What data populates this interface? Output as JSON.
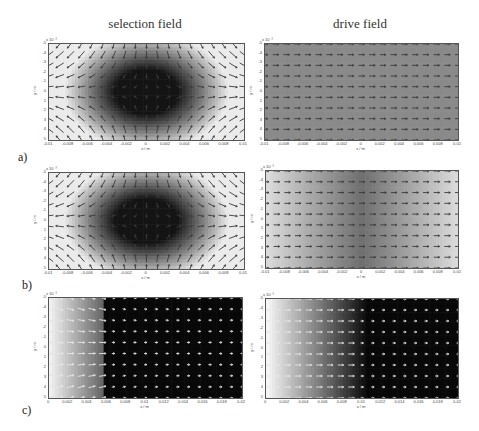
{
  "columns": {
    "left_title": "selection field",
    "right_title": "drive field"
  },
  "panel_labels": [
    "a)",
    "b)",
    "c)"
  ],
  "axes": {
    "exponent": "x 10⁻³",
    "xlabel": "x / m",
    "ylabel": "y / m",
    "yticks": [
      "-5",
      "-4",
      "-3",
      "-2",
      "-1",
      "0",
      "1",
      "2",
      "3",
      "4",
      "5"
    ],
    "xticks_symmetric": [
      "-0.01",
      "-0.008",
      "-0.006",
      "-0.004",
      "-0.002",
      "0",
      "0.002",
      "0.004",
      "0.006",
      "0.008",
      "0.01"
    ],
    "xticks_positive": [
      "0",
      "0.002",
      "0.004",
      "0.006",
      "0.008",
      "0.01",
      "0.012",
      "0.014",
      "0.016",
      "0.018",
      "0.02"
    ]
  },
  "chart_data": [
    {
      "id": "a-selection",
      "type": "heatmap",
      "title": "selection field",
      "panel": "a)",
      "description": "Quiver plot over grayscale field magnitude; dark ellipse (field-free region) centered at origin, arrows pointing inward along y and outward along x",
      "xlabel": "x / m",
      "ylabel": "y / m",
      "xlim": [
        -0.01,
        0.01
      ],
      "ylim": [
        -0.005,
        0.005
      ],
      "xticks": [
        "-0.01",
        "-0.008",
        "-0.006",
        "-0.004",
        "-0.002",
        "0",
        "0.002",
        "0.004",
        "0.006",
        "0.008",
        "0.01"
      ],
      "yticks": [
        "-5",
        "-4",
        "-3",
        "-2",
        "-1",
        "0",
        "1",
        "2",
        "3",
        "4",
        "5"
      ],
      "y_scale": "x 10^-3",
      "dark_region": {
        "center": [
          0,
          0
        ],
        "half_width_x": 0.0035,
        "half_height_y": 0.0025
      }
    },
    {
      "id": "a-drive",
      "type": "heatmap",
      "title": "drive field",
      "panel": "a)",
      "description": "Uniform gray field with horizontal arrows pointing in +x direction",
      "xlabel": "x / m",
      "ylabel": "y / m",
      "xlim": [
        -0.01,
        0.01
      ],
      "ylim": [
        -0.005,
        0.005
      ],
      "xticks": [
        "-0.01",
        "-0.008",
        "-0.006",
        "-0.004",
        "-0.002",
        "0",
        "0.002",
        "0.004",
        "0.006",
        "0.008",
        "0.01"
      ],
      "yticks": [
        "-5",
        "-4",
        "-3",
        "-2",
        "-1",
        "0",
        "1",
        "2",
        "3",
        "4",
        "5"
      ],
      "y_scale": "x 10^-3",
      "uniform_gray": "#8a8a8a"
    },
    {
      "id": "b-selection",
      "type": "heatmap",
      "title": "selection field",
      "panel": "b)",
      "description": "Same as a) selection field: dark elliptical field-free region at center with converging/diverging arrows",
      "xlabel": "x / m",
      "ylabel": "y / m",
      "xlim": [
        -0.01,
        0.01
      ],
      "ylim": [
        -0.005,
        0.005
      ],
      "xticks": [
        "-0.01",
        "-0.008",
        "-0.006",
        "-0.004",
        "-0.002",
        "0",
        "0.002",
        "0.004",
        "0.006",
        "0.008",
        "0.01"
      ],
      "yticks": [
        "-5",
        "-4",
        "-3",
        "-2",
        "-1",
        "0",
        "1",
        "2",
        "3",
        "4",
        "5"
      ],
      "y_scale": "x 10^-3"
    },
    {
      "id": "b-drive",
      "type": "heatmap",
      "title": "drive field",
      "panel": "b)",
      "description": "Gray field darker at center, lighter toward x edges; horizontal arrows pointing +x",
      "xlabel": "x / m",
      "ylabel": "y / m",
      "xlim": [
        -0.01,
        0.01
      ],
      "ylim": [
        -0.005,
        0.005
      ],
      "xticks": [
        "-0.01",
        "-0.008",
        "-0.006",
        "-0.004",
        "-0.002",
        "0",
        "0.002",
        "0.004",
        "0.006",
        "0.008",
        "0.01"
      ],
      "yticks": [
        "-5",
        "-4",
        "-3",
        "-2",
        "-1",
        "0",
        "1",
        "2",
        "3",
        "4",
        "5"
      ],
      "y_scale": "x 10^-3"
    },
    {
      "id": "c-selection",
      "type": "heatmap",
      "title": "selection field",
      "panel": "c)",
      "description": "Light gradient at x=0 to ~0.006, black beyond; small white arrows",
      "xlabel": "x / m",
      "ylabel": "y / m",
      "xlim": [
        0,
        0.02
      ],
      "ylim": [
        -0.005,
        0.005
      ],
      "xticks": [
        "0",
        "0.002",
        "0.004",
        "0.006",
        "0.008",
        "0.01",
        "0.012",
        "0.014",
        "0.016",
        "0.018",
        "0.02"
      ],
      "yticks": [
        "-5",
        "-4",
        "-3",
        "-2",
        "-1",
        "0",
        "1",
        "2",
        "3",
        "4",
        "5"
      ],
      "y_scale": "x 10^-3",
      "transition_x": 0.006
    },
    {
      "id": "c-drive",
      "type": "heatmap",
      "title": "drive field",
      "panel": "c)",
      "description": "White at left fading to black by x~0.01; small white horizontal arrows",
      "xlabel": "x / m",
      "ylabel": "y / m",
      "xlim": [
        0,
        0.02
      ],
      "ylim": [
        -0.005,
        0.005
      ],
      "xticks": [
        "0",
        "0.002",
        "0.004",
        "0.006",
        "0.008",
        "0.01",
        "0.012",
        "0.014",
        "0.016",
        "0.018",
        "0.02"
      ],
      "yticks": [
        "-5",
        "-4",
        "-3",
        "-2",
        "-1",
        "0",
        "1",
        "2",
        "3",
        "4",
        "5"
      ],
      "y_scale": "x 10^-3",
      "transition_x": 0.01
    }
  ]
}
